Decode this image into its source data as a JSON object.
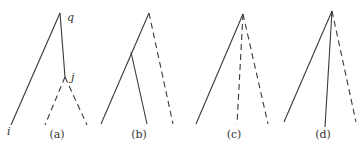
{
  "diagram": {
    "title": "",
    "panels": [
      {
        "id": "a",
        "caption": "(a)",
        "nodes": [
          {
            "id": "q",
            "label": "q",
            "x": 60,
            "y": 13,
            "lx": 67,
            "ly": 21
          },
          {
            "id": "j",
            "label": "j",
            "x": 65,
            "y": 77,
            "lx": 71,
            "ly": 81
          },
          {
            "id": "i",
            "label": "i",
            "x": 11,
            "y": 125,
            "lx": 7,
            "ly": 135
          }
        ],
        "edges": [
          {
            "from": [
              60,
              13
            ],
            "to": [
              11,
              125
            ],
            "style": "solid"
          },
          {
            "from": [
              60,
              13
            ],
            "to": [
              65,
              77
            ],
            "style": "solid"
          },
          {
            "from": [
              65,
              77
            ],
            "to": [
              45,
              125
            ],
            "style": "dashed"
          },
          {
            "from": [
              65,
              77
            ],
            "to": [
              87,
              125
            ],
            "style": "dashed"
          }
        ],
        "caption_pos": [
          57,
          138
        ]
      },
      {
        "id": "b",
        "caption": "(b)",
        "nodes": [],
        "edges": [
          {
            "from": [
              149,
              13
            ],
            "to": [
              101,
              124
            ],
            "style": "solid"
          },
          {
            "from": [
              131,
              52
            ],
            "to": [
              147,
              124
            ],
            "style": "solid"
          },
          {
            "from": [
              149,
              13
            ],
            "to": [
              173,
              124
            ],
            "style": "dashed"
          }
        ],
        "caption_pos": [
          139,
          138
        ]
      },
      {
        "id": "c",
        "caption": "(c)",
        "nodes": [],
        "edges": [
          {
            "from": [
              243,
              14
            ],
            "to": [
              196,
              124
            ],
            "style": "solid"
          },
          {
            "from": [
              243,
              14
            ],
            "to": [
              237,
              124
            ],
            "style": "dashed"
          },
          {
            "from": [
              243,
              14
            ],
            "to": [
              268,
              124
            ],
            "style": "dashed"
          }
        ],
        "caption_pos": [
          234,
          138
        ]
      },
      {
        "id": "d",
        "caption": "(d)",
        "nodes": [],
        "edges": [
          {
            "from": [
              332,
              11
            ],
            "to": [
              284,
              122
            ],
            "style": "solid"
          },
          {
            "from": [
              332,
              11
            ],
            "to": [
              325,
              127
            ],
            "style": "solid"
          },
          {
            "from": [
              332,
              11
            ],
            "to": [
              356,
              122
            ],
            "style": "dashed"
          }
        ],
        "caption_pos": [
          323,
          138
        ]
      }
    ]
  }
}
